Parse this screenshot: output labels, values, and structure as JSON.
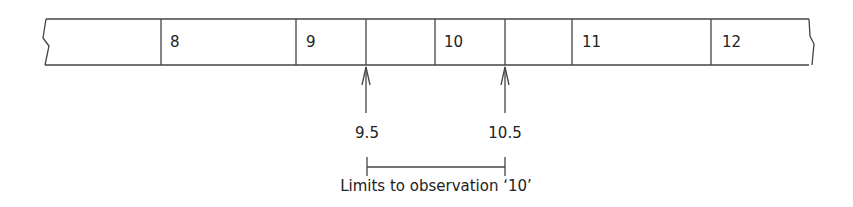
{
  "diagram": {
    "strip": {
      "cells": [
        {
          "label": ""
        },
        {
          "label": "8"
        },
        {
          "label": "9"
        },
        {
          "label": ""
        },
        {
          "label": "10"
        },
        {
          "label": ""
        },
        {
          "label": "11"
        },
        {
          "label": "12"
        }
      ]
    },
    "boundaries": [
      {
        "label": "9.5"
      },
      {
        "label": "10.5"
      }
    ],
    "caption": "Limits to observation ‘10’"
  }
}
